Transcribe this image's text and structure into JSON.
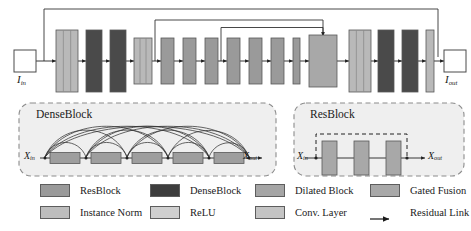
{
  "figure": {
    "kind": "neural-network-architecture-diagram",
    "input_label": "I",
    "input_sub": "in",
    "output_label": "I",
    "output_sub": "out"
  },
  "pipeline": {
    "blocks": [
      {
        "id": "conv-in-stack",
        "type": "conv-norm-relu-stack",
        "x": 56,
        "w": 22,
        "h": 62,
        "fill": "#b9b9b9",
        "stripes": true
      },
      {
        "id": "denseblock-1",
        "type": "DenseBlock",
        "x": 86,
        "w": 16,
        "h": 62,
        "fill": "#4a4a4a",
        "stripes": false
      },
      {
        "id": "denseblock-2",
        "type": "DenseBlock",
        "x": 110,
        "w": 16,
        "h": 62,
        "fill": "#4a4a4a",
        "stripes": false
      },
      {
        "id": "conv-stack-2",
        "type": "conv-norm-relu-stack",
        "x": 134,
        "w": 18,
        "h": 46,
        "fill": "#b9b9b9",
        "stripes": true
      },
      {
        "id": "dilated-1",
        "type": "Dilated Block",
        "x": 161,
        "w": 13,
        "h": 46,
        "fill": "#9a9a9a",
        "stripes": false
      },
      {
        "id": "dilated-2",
        "type": "Dilated Block",
        "x": 183,
        "w": 13,
        "h": 46,
        "fill": "#9a9a9a",
        "stripes": false
      },
      {
        "id": "dilated-3",
        "type": "Dilated Block",
        "x": 205,
        "w": 13,
        "h": 46,
        "fill": "#9a9a9a",
        "stripes": false
      },
      {
        "id": "resblock-1",
        "type": "ResBlock",
        "x": 227,
        "w": 13,
        "h": 46,
        "fill": "#9a9a9a",
        "stripes": false
      },
      {
        "id": "resblock-2",
        "type": "ResBlock",
        "x": 249,
        "w": 13,
        "h": 46,
        "fill": "#9a9a9a",
        "stripes": false
      },
      {
        "id": "resblock-3",
        "type": "ResBlock",
        "x": 271,
        "w": 13,
        "h": 46,
        "fill": "#9a9a9a",
        "stripes": false
      },
      {
        "id": "instance-norm",
        "type": "Instance Norm",
        "x": 293,
        "w": 7,
        "h": 46,
        "fill": "#9a9a9a",
        "stripes": false
      },
      {
        "id": "gated-fusion",
        "type": "Gated Fusion",
        "x": 309,
        "w": 28,
        "h": 52,
        "fill": "#a8a8a8",
        "stripes": false
      },
      {
        "id": "conv-stack-3",
        "type": "conv-norm-relu-stack",
        "x": 349,
        "w": 22,
        "h": 62,
        "fill": "#b9b9b9",
        "stripes": true
      },
      {
        "id": "denseblock-3",
        "type": "DenseBlock",
        "x": 378,
        "w": 16,
        "h": 62,
        "fill": "#4a4a4a",
        "stripes": false
      },
      {
        "id": "denseblock-4",
        "type": "DenseBlock",
        "x": 402,
        "w": 16,
        "h": 62,
        "fill": "#4a4a4a",
        "stripes": false
      },
      {
        "id": "conv-out",
        "type": "Conv. Layer",
        "x": 426,
        "w": 8,
        "h": 62,
        "fill": "#b9b9b9",
        "stripes": false
      }
    ],
    "residual_links": [
      {
        "id": "skip-long",
        "from_x": 44,
        "to_x": 438,
        "top_y": 9
      },
      {
        "id": "skip-mid",
        "from_x": 155,
        "to_x": 323,
        "top_y": 20
      },
      {
        "id": "skip-short",
        "from_x": 221,
        "to_x": 323,
        "top_y": 27
      }
    ]
  },
  "dense_panel": {
    "title": "DenseBlock",
    "in_label": "X",
    "in_sub": "in",
    "out_label": "X",
    "out_sub": "out",
    "unit_count": 5
  },
  "res_panel": {
    "title": "ResBlock",
    "in_label": "X",
    "in_sub": "in",
    "out_label": "X",
    "out_sub": "out",
    "unit_count": 3
  },
  "legend": {
    "rows": [
      [
        {
          "label": "ResBlock",
          "color": "#9a9a9a",
          "swatch": "box"
        },
        {
          "label": "DenseBlock",
          "color": "#3d3d3d",
          "swatch": "box"
        },
        {
          "label": "Dilated Block",
          "color": "#a5a5a5",
          "swatch": "box"
        },
        {
          "label": "Gated Fusion",
          "color": "#a8a8a8",
          "swatch": "box"
        }
      ],
      [
        {
          "label": "Instance Norm",
          "color": "#bdbdbd",
          "swatch": "box"
        },
        {
          "label": "ReLU",
          "color": "#cfcfcf",
          "swatch": "box"
        },
        {
          "label": "Conv. Layer",
          "color": "#c4c4c4",
          "swatch": "box"
        },
        {
          "label": "Residual Link",
          "color": "#1a1a1a",
          "swatch": "arrow"
        }
      ]
    ]
  },
  "colors": {
    "stroke": "#4a4a4a",
    "line": "#333333",
    "panel_fill": "#efefef",
    "panel_border": "#8c8c8c",
    "background": "#ffffff"
  }
}
